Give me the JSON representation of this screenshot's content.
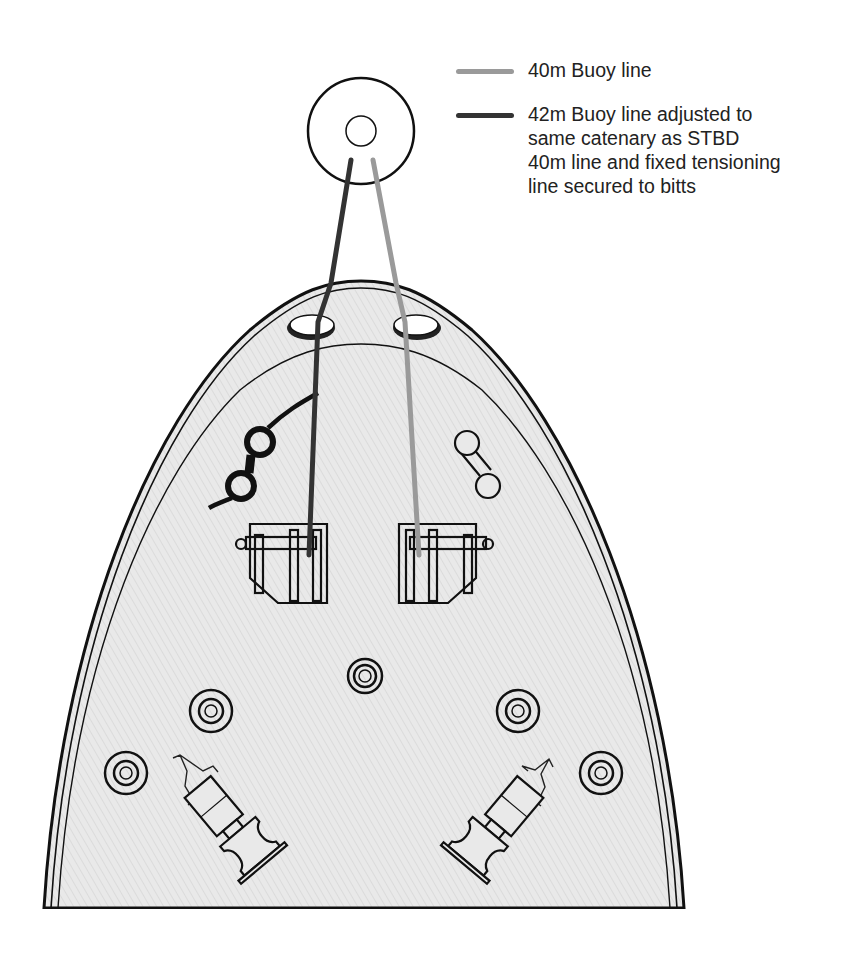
{
  "legend": {
    "items": [
      {
        "label": "40m Buoy line",
        "color": "#9a9a9a"
      },
      {
        "label": "42m Buoy line adjusted to same catenary as STBD 40m line and fixed tensioning line secured to bitts",
        "color": "#333333",
        "lines": [
          "42m Buoy line adjusted to",
          "same catenary as STBD",
          "40m line and fixed tensioning",
          "line secured to bitts"
        ]
      }
    ]
  },
  "colors": {
    "deck_fill": "#e6e6e6",
    "outline": "#111111",
    "stbd_line": "#9a9a9a",
    "port_line": "#333333"
  },
  "diagram": {
    "buoy": {
      "label": "mooring-buoy"
    },
    "hull": {
      "label": "bow-deck-plan"
    },
    "fairleads": [
      "port-fairlead",
      "stbd-fairlead"
    ],
    "winches": [
      "port-mooring-winch",
      "stbd-mooring-winch"
    ],
    "bitts": [
      "port-bitts",
      "stbd-bitts"
    ],
    "bollards": 5,
    "rollers": [
      "port-roller-fairlead",
      "stbd-roller-fairlead"
    ]
  }
}
